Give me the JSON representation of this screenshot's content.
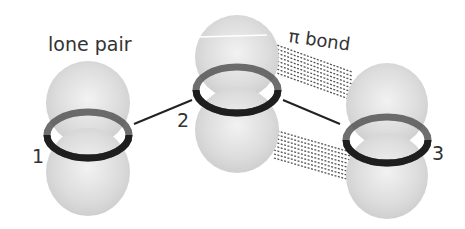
{
  "diagram": {
    "labels": {
      "lone_pair": "lone pair",
      "pi_bond": "π bond",
      "atom1": "1",
      "atom2": "2",
      "atom3": "3"
    },
    "atoms": [
      {
        "id": "1",
        "cx": 88,
        "ring_cy": 135
      },
      {
        "id": "2",
        "cx": 237,
        "ring_cy": 90
      },
      {
        "id": "3",
        "cx": 387,
        "ring_cy": 140
      }
    ],
    "colors": {
      "lobe": "#d6d6d6",
      "ring": "#1e1e1e",
      "bond_line": "#222222",
      "pi_dash": "#555555",
      "text": "#333333"
    }
  }
}
